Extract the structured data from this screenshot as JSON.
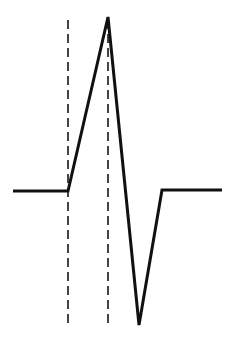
{
  "diagram": {
    "type": "waveform",
    "colors": {
      "background": "#ffffff",
      "waveform": "#111111",
      "markers": "#444444"
    },
    "waveform_points": [
      [
        13,
        191
      ],
      [
        68,
        191
      ],
      [
        108,
        17
      ],
      [
        139,
        325
      ],
      [
        162,
        190
      ],
      [
        222,
        190
      ]
    ],
    "markers": [
      {
        "x": 68,
        "y1": 20,
        "y2": 328
      },
      {
        "x": 108,
        "y1": 20,
        "y2": 328
      }
    ]
  }
}
